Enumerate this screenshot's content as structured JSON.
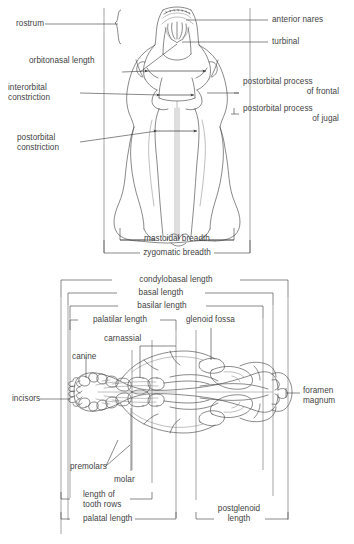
{
  "figure": {
    "panels": [
      {
        "id": "dorsal",
        "view_name": "dorsal-skull-view"
      },
      {
        "id": "ventral",
        "view_name": "ventral-skull-view"
      }
    ]
  },
  "dorsal": {
    "labels": {
      "rostrum": "rostrum",
      "anterior_nares": "anterior nares",
      "turbinal": "turbinal",
      "orbitonasal_length": "orbitonasal length",
      "interorbital_constriction_l1": "interorbital",
      "interorbital_constriction_l2": "constriction",
      "postorbital_process_frontal_l1": "postorbital process",
      "postorbital_process_frontal_l2": "of frontal",
      "postorbital_process_jugal_l1": "postorbital process",
      "postorbital_process_jugal_l2": "of jugal",
      "postorbital_constriction_l1": "postorbital",
      "postorbital_constriction_l2": "constriction",
      "mastoidal_breadth": "mastoidal breadth",
      "zygomatic_breadth": "zygomatic breadth"
    }
  },
  "ventral": {
    "labels": {
      "condylobasal_length": "condylobasal length",
      "basal_length": "basal length",
      "basilar_length": "basilar length",
      "palatilar_length": "palatilar length",
      "glenoid_fossa": "glenoid fossa",
      "carnassial": "carnassial",
      "canine": "canine",
      "incisors": "incisors",
      "foramen_magnum_l1": "foramen",
      "foramen_magnum_l2": "magnum",
      "premolars": "premolars",
      "molar": "molar",
      "length_of_tooth_rows_l1": "length of",
      "length_of_tooth_rows_l2": "tooth rows",
      "palatal_length": "palatal length",
      "postglenoid_length_l1": "postglenoid",
      "postglenoid_length_l2": "length"
    }
  },
  "colors": {
    "ink": "#3a3a3a",
    "bone_outline": "#4a4a4a",
    "faint_line": "#8a8a8a",
    "frame": "#6a6a6a",
    "background": "#ffffff"
  }
}
